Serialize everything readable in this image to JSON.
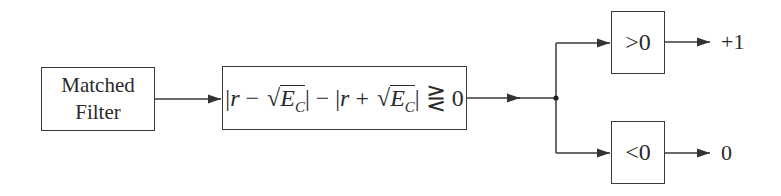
{
  "blocks": {
    "matched_filter": {
      "line1": "Matched",
      "line2": "Filter"
    },
    "decision": {
      "bar_open": "|",
      "r": "r",
      "minus": " − ",
      "plus": " + ",
      "sqrt_symbol": "√",
      "E": "E",
      "C": "C",
      "bar_close": "|",
      "between": " − ",
      "relation": " ⋛ 0",
      "full_text": "|r − √E_C| − |r + √E_C| ⋛ 0"
    },
    "greater": {
      "label": ">0"
    },
    "less": {
      "label": "<0"
    }
  },
  "outputs": {
    "greater_output": "+1",
    "less_output": "0"
  },
  "colors": {
    "line": "#3a3a3a",
    "background": "#ffffff",
    "text": "#2a2a2a"
  }
}
